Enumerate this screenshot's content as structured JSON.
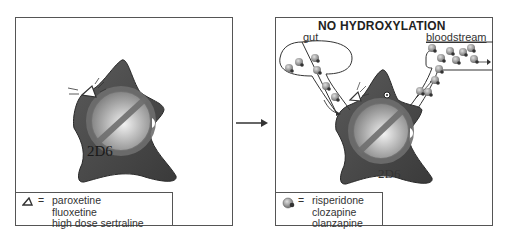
{
  "left_panel": {
    "enzyme_label": "2D6",
    "inhibitor_symbol": "triangle-icon",
    "legend": {
      "equals": "=",
      "drugs": [
        "paroxetine",
        "fluoxetine",
        "high dose sertraline"
      ]
    }
  },
  "arrow": {
    "direction": "right"
  },
  "right_panel": {
    "title": "NO HYDROXYLATION",
    "gut_label": "gut",
    "bloodstream_label": "bloodstream",
    "enzyme_label": "2D6",
    "legend": {
      "equals": "=",
      "drugs": [
        "risperidone",
        "clozapine",
        "olanzapine"
      ]
    }
  },
  "colors": {
    "enzyme_fill": "#4a4a4a",
    "no_symbol": "#6e6e6e",
    "sphere": "#bdbdbd",
    "border": "#555555"
  }
}
